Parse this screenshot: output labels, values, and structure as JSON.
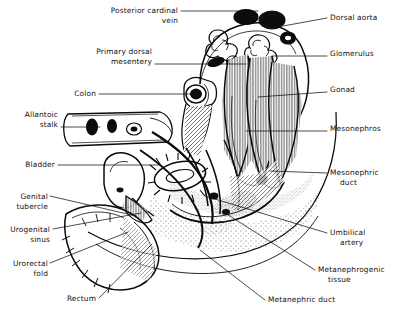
{
  "figure": {
    "background_color": "#ffffff",
    "ink_color": "#0a0a0a",
    "labels": [
      {
        "id": "posterior-cardinal-vein",
        "text_lines": [
          "Posterior cardinal",
          "vein"
        ],
        "side": "top-left",
        "x": 178,
        "y": 13,
        "align": "end",
        "leader": "M181,11 L258,11"
      },
      {
        "id": "dorsal-aorta",
        "text_lines": [
          "Dorsal aorta"
        ],
        "side": "right",
        "x": 330,
        "y": 20,
        "align": "start",
        "leader": "M283,26 L327,18"
      },
      {
        "id": "primary-dorsal-mesentery",
        "text_lines": [
          "Primary dorsal",
          "mesentery"
        ],
        "side": "left",
        "x": 152,
        "y": 54,
        "align": "end",
        "leader": "M155,64 L246,64"
      },
      {
        "id": "glomerulus",
        "text_lines": [
          "Glomerulus"
        ],
        "side": "right",
        "x": 330,
        "y": 56,
        "align": "start",
        "leader": "M272,56 L327,56"
      },
      {
        "id": "colon",
        "text_lines": [
          "Colon"
        ],
        "side": "left",
        "x": 96,
        "y": 96,
        "align": "end",
        "leader": "M99,94 L196,94"
      },
      {
        "id": "gonad",
        "text_lines": [
          "Gonad"
        ],
        "side": "right",
        "x": 330,
        "y": 92,
        "align": "start",
        "leader": "M258,97 L327,92"
      },
      {
        "id": "allantoic-stalk",
        "text_lines": [
          "Allantoic",
          "stalk"
        ],
        "side": "left",
        "x": 58,
        "y": 117,
        "align": "end",
        "leader": "M61,127 L100,127"
      },
      {
        "id": "mesonephros",
        "text_lines": [
          "Mesonephros"
        ],
        "side": "right",
        "x": 330,
        "y": 131,
        "align": "start",
        "leader": "M246,131 L327,131"
      },
      {
        "id": "bladder",
        "text_lines": [
          "Bladder"
        ],
        "side": "left",
        "x": 55,
        "y": 167,
        "align": "end",
        "leader": "M58,165 L160,165"
      },
      {
        "id": "mesonephric-duct",
        "text_lines": [
          "Mesonephric",
          "duct"
        ],
        "side": "right",
        "x": 330,
        "y": 175,
        "align": "start",
        "leader": "M270,171 L327,173"
      },
      {
        "id": "genital-tubercle",
        "text_lines": [
          "Genital",
          "tubercle"
        ],
        "side": "left",
        "x": 48,
        "y": 199,
        "align": "end",
        "leader": "M50,196 L136,216"
      },
      {
        "id": "urogenital-sinus",
        "text_lines": [
          "Urogenital",
          "sinus"
        ],
        "side": "left",
        "x": 50,
        "y": 232,
        "align": "end",
        "leader": "M53,229 L141,213"
      },
      {
        "id": "umbilical-artery",
        "text_lines": [
          "Umbilical",
          "artery"
        ],
        "side": "right",
        "x": 330,
        "y": 235,
        "align": "start",
        "leader": "M205,196 L327,233"
      },
      {
        "id": "urorectal-fold",
        "text_lines": [
          "Urorectal",
          "fold"
        ],
        "side": "left",
        "x": 48,
        "y": 266,
        "align": "end",
        "leader": "M50,263 L128,232"
      },
      {
        "id": "metanephrogenic-tissue",
        "text_lines": [
          "Metanephrogenic",
          "tissue"
        ],
        "side": "right",
        "x": 318,
        "y": 272,
        "align": "start",
        "leader": "M225,213 L315,270"
      },
      {
        "id": "rectum",
        "text_lines": [
          "Rectum"
        ],
        "side": "left",
        "x": 96,
        "y": 301,
        "align": "end",
        "leader": "M99,298 L152,244"
      },
      {
        "id": "metanephric-duct",
        "text_lines": [
          "Metanephric duct"
        ],
        "side": "bottom-right",
        "x": 268,
        "y": 302,
        "align": "start",
        "leader": "M200,250 L265,300"
      }
    ],
    "structures": [
      {
        "id": "body-wall-outline",
        "description": "large stippled arc forming posterior body wall"
      },
      {
        "id": "dorsal-aorta-lumens",
        "description": "dark oval vessel lumens at dorsal margin"
      },
      {
        "id": "glomeruli-coils",
        "description": "convoluted coiled tufts in mesonephric region"
      },
      {
        "id": "mesonephric-ridges",
        "description": "elongated hatched longitudinal ridges"
      },
      {
        "id": "colon-tube",
        "description": "cut tube with dark lumen at left"
      },
      {
        "id": "allantoic-stalk-lumens",
        "description": "two dark circular arterial lumens"
      },
      {
        "id": "bladder-sac",
        "description": "rounded sac lower left"
      },
      {
        "id": "rectum-tube",
        "description": "tapering tube to cloaca region"
      },
      {
        "id": "stipple-field",
        "description": "dotted mesenchyme shading"
      }
    ]
  }
}
